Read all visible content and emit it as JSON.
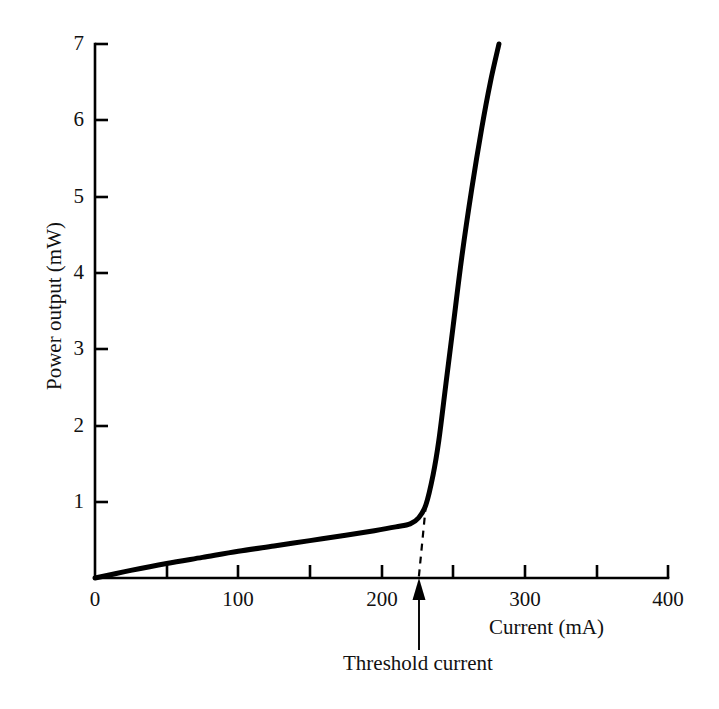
{
  "figure": {
    "background_color": "#ffffff",
    "ink_color": "#000000"
  },
  "chart_data": {
    "type": "line",
    "title": "",
    "xlabel": "Current (mA)",
    "ylabel": "Power output (mW)",
    "xlim": [
      0,
      400
    ],
    "ylim": [
      0,
      7
    ],
    "xticks": [
      0,
      50,
      100,
      150,
      200,
      250,
      300,
      350,
      400
    ],
    "xtick_labels": [
      "0",
      "",
      "100",
      "",
      "200",
      "",
      "300",
      "",
      "400"
    ],
    "yticks": [
      0,
      1,
      2,
      3,
      4,
      5,
      6,
      7
    ],
    "ytick_labels": [
      "",
      "1",
      "2",
      "3",
      "4",
      "5",
      "6",
      "7"
    ],
    "grid": false,
    "legend": "none",
    "series": [
      {
        "name": "Laser diode L-I characteristic",
        "line_width_px": 5,
        "color": "#000000",
        "x": [
          0,
          10,
          25,
          50,
          75,
          100,
          125,
          150,
          175,
          195,
          210,
          220,
          226,
          231,
          236,
          240,
          245,
          250,
          256,
          263,
          270,
          276,
          282
        ],
        "y": [
          0.0,
          0.04,
          0.1,
          0.19,
          0.27,
          0.35,
          0.42,
          0.49,
          0.56,
          0.62,
          0.67,
          0.71,
          0.79,
          0.96,
          1.35,
          1.8,
          2.55,
          3.3,
          4.2,
          5.1,
          5.9,
          6.5,
          7.0
        ]
      }
    ],
    "annotations": [
      {
        "name": "threshold-dashed-line",
        "type": "dashed-line",
        "from": {
          "x": 231,
          "y": 0.96
        },
        "to": {
          "x": 226,
          "y": 0.0
        },
        "dash": "7,6",
        "width_px": 2.2
      },
      {
        "name": "threshold-arrow",
        "type": "arrow",
        "points_to": {
          "x": 226,
          "y": 0.0
        },
        "tail_y_px": 650,
        "label": "Threshold current"
      }
    ]
  },
  "axes": {
    "x_title": "Current (mA)",
    "y_title": "Power output (mW)",
    "x_tick_values": [
      "0",
      "100",
      "200",
      "300",
      "400"
    ],
    "y_tick_values": [
      "1",
      "2",
      "3",
      "4",
      "5",
      "6",
      "7"
    ]
  },
  "annotation": {
    "threshold_label": "Threshold current"
  },
  "caption": {
    "partial_text": ""
  }
}
